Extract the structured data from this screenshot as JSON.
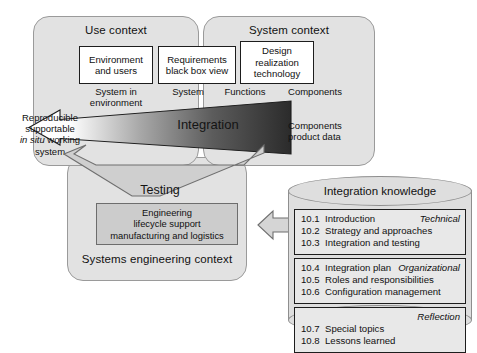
{
  "diagram": {
    "colors": {
      "panel_fill": "#e2e2e2",
      "panel_stroke": "#9a9a9a",
      "box_fill": "#ffffff",
      "box_stroke": "#1d1d1d",
      "grey_box_fill": "#cccccc",
      "cylinder_fill": "#dedede",
      "knowledge_box_fill": "#e8e8e8",
      "arrow_dark": "#3a3a3a",
      "arrow_light": "#ffffff",
      "funnel_fill": "#cfcfcf"
    }
  },
  "use_context": {
    "title": "Use context",
    "box": {
      "line1": "Environment",
      "line2": "and users"
    },
    "under_label": {
      "line1": "System in",
      "line2": "environment"
    },
    "output_label": {
      "line1": "Reproducible",
      "line2": "supportable",
      "line3_italic": "in situ",
      "line3_rest": " working",
      "line4": "system"
    }
  },
  "system_context": {
    "title": "System context",
    "box_requirements": {
      "line1": "Requirements",
      "line2": "black box view"
    },
    "box_design": {
      "line1": "Design",
      "line2": "realization",
      "line3": "technology"
    },
    "label_system": "System",
    "label_functions": "Functions",
    "label_components": "Components",
    "components_note": {
      "line1": "Components",
      "line2": "product data"
    }
  },
  "integration_arrow": {
    "label": "Integration"
  },
  "testing": {
    "funnel_label": "Testing",
    "context_title": "Systems engineering context",
    "grey_box": {
      "line1": "Engineering",
      "line2": "lifecycle support",
      "line3": "manufacturing and logistics"
    }
  },
  "knowledge": {
    "title": "Integration knowledge",
    "groups": [
      {
        "tag": "Technical",
        "items": [
          {
            "num": "10.1",
            "text": "Introduction"
          },
          {
            "num": "10.2",
            "text": "Strategy and approaches"
          },
          {
            "num": "10.3",
            "text": "Integration and testing"
          }
        ]
      },
      {
        "tag": "Organizational",
        "items": [
          {
            "num": "10.4",
            "text": "Integration plan"
          },
          {
            "num": "10.5",
            "text": "Roles and responsibilities"
          },
          {
            "num": "10.6",
            "text": "Configuration management"
          }
        ]
      },
      {
        "tag": "Reflection",
        "items": [
          {
            "num": "10.7",
            "text": "Special topics"
          },
          {
            "num": "10.8",
            "text": "Lessons learned"
          }
        ]
      }
    ]
  }
}
